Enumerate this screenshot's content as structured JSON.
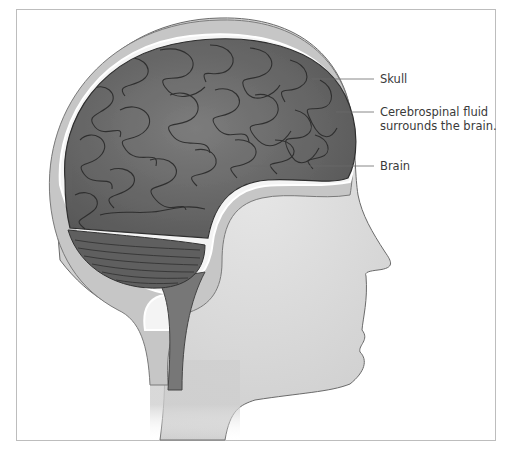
{
  "diagram": {
    "labels": [
      {
        "id": "skull",
        "text_lines": [
          "Skull"
        ]
      },
      {
        "id": "csf",
        "text_lines": [
          "Cerebrospinal fluid",
          "surrounds the brain."
        ]
      },
      {
        "id": "brain",
        "text_lines": [
          "Brain"
        ]
      }
    ],
    "colors": {
      "background": "#ffffff",
      "frame_border": "#bdbdbd",
      "skin": "#d9d9d9",
      "skull": "#c4c4c4",
      "csf_gap": "#f2f2f2",
      "brain": "#6e6e6e",
      "cerebellum": "#5a5a5a",
      "leader_line": "#6a6a6a",
      "label_text": "#3a3a3a"
    }
  }
}
